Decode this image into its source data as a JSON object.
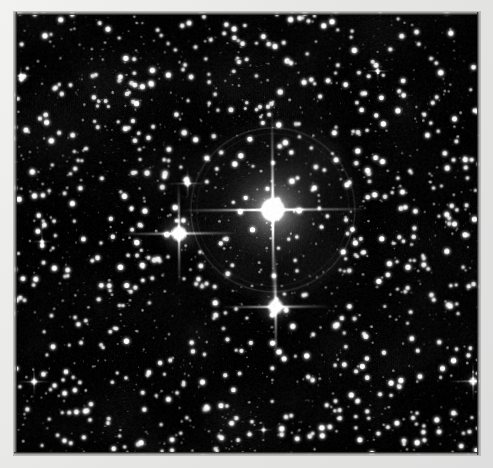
{
  "image": {
    "kind": "astrophotograph",
    "subject": "dense star field with three bright stars showing diffraction spikes",
    "palette": {
      "border": "#ebebe9",
      "sky": "#000000",
      "star": "#ffffff",
      "halo": "#8c8c8c",
      "spike": "#f2f2f2"
    },
    "plate": {
      "x": 14,
      "y": 12,
      "width": 466,
      "height": 443,
      "rotation_deg": -0.45
    },
    "background_star_count": 2600,
    "bright_stars": [
      {
        "name": "primary-star",
        "x": 273,
        "y": 210,
        "core_radius": 13,
        "glow_radius": 58,
        "spike_h": 96,
        "spike_v": 100,
        "halo_ring_radius": 82,
        "brightness": 1.0
      },
      {
        "name": "secondary-star",
        "x": 179,
        "y": 233,
        "core_radius": 9,
        "glow_radius": 26,
        "spike_h": 58,
        "spike_v": 52,
        "halo_ring_radius": 0,
        "brightness": 0.8
      },
      {
        "name": "tertiary-star",
        "x": 275,
        "y": 307,
        "core_radius": 9,
        "glow_radius": 24,
        "spike_h": 55,
        "spike_v": 56,
        "halo_ring_radius": 0,
        "brightness": 0.78
      },
      {
        "name": "edge-star-right",
        "x": 472,
        "y": 383,
        "core_radius": 5,
        "glow_radius": 12,
        "spike_h": 26,
        "spike_v": 20,
        "halo_ring_radius": 0,
        "brightness": 0.55
      },
      {
        "name": "field-star-upper-left",
        "x": 188,
        "y": 183,
        "core_radius": 4,
        "glow_radius": 9,
        "spike_h": 18,
        "spike_v": 16,
        "halo_ring_radius": 0,
        "brightness": 0.5
      },
      {
        "name": "field-star-lower-left",
        "x": 33,
        "y": 380,
        "core_radius": 4,
        "glow_radius": 9,
        "spike_h": 17,
        "spike_v": 15,
        "halo_ring_radius": 0,
        "brightness": 0.48
      },
      {
        "name": "field-star-upper-right",
        "x": 379,
        "y": 72,
        "core_radius": 3,
        "glow_radius": 7,
        "spike_h": 12,
        "spike_v": 11,
        "halo_ring_radius": 0,
        "brightness": 0.42
      },
      {
        "name": "field-star-top-left",
        "x": 22,
        "y": 74,
        "core_radius": 3,
        "glow_radius": 7,
        "spike_h": 12,
        "spike_v": 11,
        "halo_ring_radius": 0,
        "brightness": 0.4
      },
      {
        "name": "field-star-mid-left",
        "x": 42,
        "y": 240,
        "core_radius": 3,
        "glow_radius": 6,
        "spike_h": 11,
        "spike_v": 10,
        "halo_ring_radius": 0,
        "brightness": 0.4
      },
      {
        "name": "field-star-bottom-mid",
        "x": 262,
        "y": 430,
        "core_radius": 3,
        "glow_radius": 6,
        "spike_h": 10,
        "spike_v": 9,
        "halo_ring_radius": 0,
        "brightness": 0.38
      }
    ]
  }
}
